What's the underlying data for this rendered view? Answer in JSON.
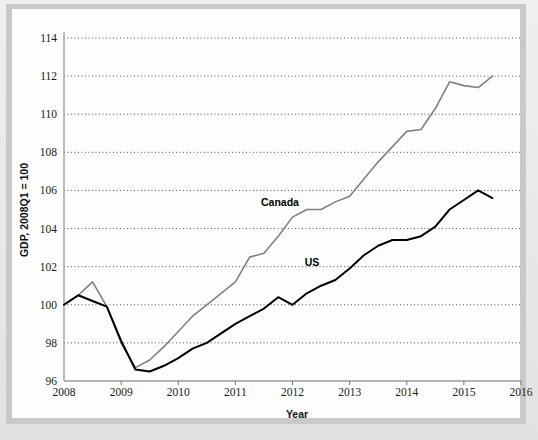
{
  "figure": {
    "background_color": "#e8e8e8",
    "panel_color": "#fdfdfd",
    "frame_color": "#c9c9c9"
  },
  "axes": {
    "y_title": "GDP, 2008Q1 = 100",
    "x_title": "Year",
    "y_ticks": [
      "96",
      "98",
      "100",
      "102",
      "104",
      "106",
      "108",
      "110",
      "112",
      "114"
    ],
    "x_ticks": [
      "2008",
      "2009",
      "2010",
      "2011",
      "2012",
      "2013",
      "2014",
      "2015",
      "2016"
    ]
  },
  "annotations": {
    "canada_label": "Canada",
    "us_label": "US"
  },
  "chart_data": {
    "type": "line",
    "title": "",
    "subtitle": "",
    "xlabel": "Year",
    "ylabel": "GDP, 2008Q1 = 100",
    "xlim": [
      2008,
      2016
    ],
    "ylim": [
      96,
      114
    ],
    "yticks": [
      96,
      98,
      100,
      102,
      104,
      106,
      108,
      110,
      112,
      114
    ],
    "xticks": [
      2008,
      2009,
      2010,
      2011,
      2012,
      2013,
      2014,
      2015,
      2016
    ],
    "grid": "horizontal-dotted",
    "legend": "inline-labels",
    "x": [
      2008.0,
      2008.25,
      2008.5,
      2008.75,
      2009.0,
      2009.25,
      2009.5,
      2009.75,
      2010.0,
      2010.25,
      2010.5,
      2010.75,
      2011.0,
      2011.25,
      2011.5,
      2011.75,
      2012.0,
      2012.25,
      2012.5,
      2012.75,
      2013.0,
      2013.25,
      2013.5,
      2013.75,
      2014.0,
      2014.25,
      2014.5,
      2014.75,
      2015.0,
      2015.25,
      2015.5
    ],
    "x_tick_labels": [
      "2008Q1",
      "2008Q2",
      "2008Q3",
      "2008Q4",
      "2009Q1",
      "2009Q2",
      "2009Q3",
      "2009Q4",
      "2010Q1",
      "2010Q2",
      "2010Q3",
      "2010Q4",
      "2011Q1",
      "2011Q2",
      "2011Q3",
      "2011Q4",
      "2012Q1",
      "2012Q2",
      "2012Q3",
      "2012Q4",
      "2013Q1",
      "2013Q2",
      "2013Q3",
      "2013Q4",
      "2014Q1",
      "2014Q2",
      "2014Q3",
      "2014Q4",
      "2015Q1",
      "2015Q2",
      "2015Q3"
    ],
    "series": [
      {
        "name": "Canada",
        "color": "#808080",
        "linewidth": 1.6,
        "values": [
          100.0,
          100.5,
          101.2,
          99.9,
          98.0,
          96.7,
          97.1,
          97.8,
          98.6,
          99.4,
          100.0,
          100.6,
          101.2,
          102.5,
          102.7,
          103.6,
          104.6,
          105.0,
          105.0,
          105.4,
          105.7,
          106.6,
          107.5,
          108.3,
          109.1,
          109.2,
          110.3,
          111.7,
          111.5,
          111.4,
          112.0
        ]
      },
      {
        "name": "US",
        "color": "#000000",
        "linewidth": 2.0,
        "values": [
          100.0,
          100.5,
          100.2,
          99.9,
          98.1,
          96.6,
          96.5,
          96.8,
          97.2,
          97.7,
          98.0,
          98.5,
          99.0,
          99.4,
          99.8,
          100.4,
          100.0,
          100.6,
          101.0,
          101.3,
          101.9,
          102.6,
          103.1,
          103.4,
          103.4,
          103.6,
          104.1,
          105.0,
          105.5,
          106.0,
          105.6
        ]
      }
    ],
    "series_extra": [
      {
        "name": "US-tail",
        "values_note": "continuation after 2015Q3 dip",
        "values": [
          106.2,
          107.2,
          108.1,
          108.4,
          108.7,
          109.6,
          110.3
        ]
      }
    ]
  }
}
